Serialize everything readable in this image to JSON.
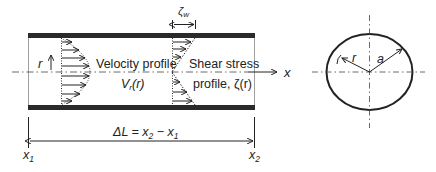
{
  "diagram": {
    "pipe": {
      "labels": {
        "r": "r",
        "velocity_profile": "Velocity profile",
        "velocity_symbol": "V",
        "velocity_sub": "r",
        "velocity_arg": "(r)",
        "shear_stress": "Shear stress",
        "shear_profile": "profile, ζ(r)",
        "x_axis": "x",
        "zeta_w": "ζ",
        "zeta_w_sub": "w"
      }
    },
    "length": {
      "delta": "ΔL = x",
      "sub2": "2",
      "minus": " − x",
      "sub1": "1",
      "x1": "x",
      "x1_sub": "1",
      "x2": "x",
      "x2_sub": "2"
    },
    "cross_section": {
      "r_label": "r",
      "a_label": "a"
    },
    "colors": {
      "stroke": "#222222",
      "wall": "#2a2a2a"
    }
  }
}
